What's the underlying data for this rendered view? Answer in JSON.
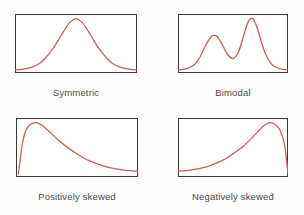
{
  "figure": {
    "background_color": "#fdfdfb",
    "curve_color": "#c4625c",
    "border_color": "#3a3a3a",
    "label_color": "#4a4a4a"
  },
  "panels": [
    {
      "id": "symmetric",
      "caption": "Symmetric"
    },
    {
      "id": "bimodal",
      "caption": "Bimodal"
    },
    {
      "id": "positively-skewed",
      "caption": "Positively skewed"
    },
    {
      "id": "negatively-skewed",
      "caption": "Negatively skewed"
    }
  ],
  "chart_data": [
    {
      "type": "line",
      "title": "Symmetric",
      "xlabel": "",
      "ylabel": "",
      "grid": false,
      "legend": "none",
      "xlim": [
        0,
        1
      ],
      "ylim": [
        0,
        1
      ],
      "description": "Unimodal bell-shaped (normal) density, mode centred at x = 0.5 with equal tails",
      "x": [
        0.0,
        0.05,
        0.1,
        0.15,
        0.2,
        0.25,
        0.3,
        0.35,
        0.4,
        0.45,
        0.5,
        0.55,
        0.6,
        0.65,
        0.7,
        0.75,
        0.8,
        0.85,
        0.9,
        0.95,
        1.0
      ],
      "y": [
        0.02,
        0.03,
        0.05,
        0.08,
        0.14,
        0.24,
        0.38,
        0.55,
        0.74,
        0.9,
        0.97,
        0.9,
        0.74,
        0.55,
        0.38,
        0.24,
        0.14,
        0.08,
        0.05,
        0.03,
        0.02
      ]
    },
    {
      "type": "line",
      "title": "Bimodal",
      "xlabel": "",
      "ylabel": "",
      "grid": false,
      "legend": "none",
      "xlim": [
        0,
        1
      ],
      "ylim": [
        0,
        1
      ],
      "description": "Two distinct modes: a lower left peak near x = 0.33 and a taller right peak near x = 0.66",
      "x": [
        0.0,
        0.05,
        0.1,
        0.15,
        0.2,
        0.25,
        0.3,
        0.33,
        0.36,
        0.4,
        0.45,
        0.5,
        0.55,
        0.6,
        0.64,
        0.68,
        0.72,
        0.78,
        0.84,
        0.9,
        0.95,
        1.0
      ],
      "y": [
        0.02,
        0.03,
        0.06,
        0.12,
        0.26,
        0.47,
        0.63,
        0.66,
        0.63,
        0.5,
        0.31,
        0.23,
        0.35,
        0.68,
        0.92,
        0.97,
        0.8,
        0.4,
        0.15,
        0.06,
        0.03,
        0.02
      ]
    },
    {
      "type": "line",
      "title": "Positively skewed",
      "xlabel": "",
      "ylabel": "",
      "grid": false,
      "legend": "none",
      "xlim": [
        0,
        1
      ],
      "ylim": [
        0,
        1
      ],
      "description": "Right-skewed density: steep rise from near zero, mode at about x = 0.17, long tail to the right",
      "x": [
        0.02,
        0.05,
        0.08,
        0.12,
        0.17,
        0.22,
        0.28,
        0.34,
        0.41,
        0.48,
        0.55,
        0.62,
        0.7,
        0.78,
        0.86,
        0.93,
        1.0
      ],
      "y": [
        0.02,
        0.55,
        0.82,
        0.94,
        0.97,
        0.91,
        0.79,
        0.66,
        0.53,
        0.42,
        0.32,
        0.25,
        0.18,
        0.13,
        0.1,
        0.08,
        0.07
      ]
    },
    {
      "type": "line",
      "title": "Negatively skewed",
      "xlabel": "",
      "ylabel": "",
      "grid": false,
      "legend": "none",
      "xlim": [
        0,
        1
      ],
      "ylim": [
        0,
        1
      ],
      "description": "Left-skewed density: long tail to the left, mode at about x = 0.83, steep fall at the right edge",
      "x": [
        0.0,
        0.07,
        0.14,
        0.22,
        0.3,
        0.38,
        0.45,
        0.52,
        0.59,
        0.66,
        0.72,
        0.78,
        0.83,
        0.88,
        0.93,
        0.97,
        1.0
      ],
      "y": [
        0.07,
        0.08,
        0.1,
        0.13,
        0.18,
        0.25,
        0.32,
        0.42,
        0.53,
        0.66,
        0.79,
        0.91,
        0.97,
        0.94,
        0.82,
        0.55,
        0.02
      ]
    }
  ]
}
